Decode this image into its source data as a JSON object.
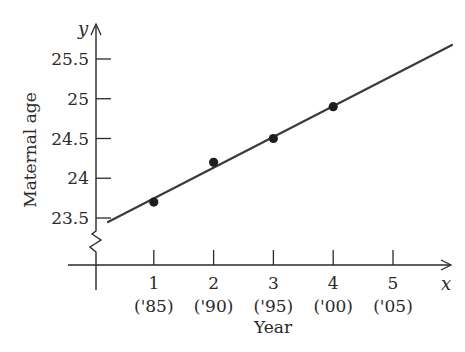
{
  "chart_data": {
    "type": "scatter",
    "title": "",
    "xlabel": "Year",
    "ylabel": "Maternal age",
    "x_axis_var": "x",
    "y_axis_var": "y",
    "x": [
      1,
      2,
      3,
      4
    ],
    "y": [
      23.7,
      24.2,
      24.5,
      24.9
    ],
    "x_ticks": [
      {
        "value": 1,
        "label": "1",
        "sublabel": "('85)"
      },
      {
        "value": 2,
        "label": "2",
        "sublabel": "('90)"
      },
      {
        "value": 3,
        "label": "3",
        "sublabel": "('95)"
      },
      {
        "value": 4,
        "label": "4",
        "sublabel": "('00)"
      },
      {
        "value": 5,
        "label": "5",
        "sublabel": "('05)"
      }
    ],
    "y_ticks": [
      {
        "value": 23.5,
        "label": "23.5"
      },
      {
        "value": 24,
        "label": "24"
      },
      {
        "value": 24.5,
        "label": "24.5"
      },
      {
        "value": 25,
        "label": "25"
      },
      {
        "value": 25.5,
        "label": "25.5"
      }
    ],
    "fit_line": {
      "x_start": 0.2,
      "y_start": 23.45,
      "x_end": 6.0,
      "y_end": 25.71
    },
    "ylim": [
      23.5,
      25.7
    ],
    "xlim": [
      0,
      6
    ],
    "y_axis_break": true,
    "grid": false,
    "legend": null
  },
  "colors": {
    "ink": "#2a2a2a",
    "line": "#3a3a3a",
    "background": "#ffffff"
  }
}
